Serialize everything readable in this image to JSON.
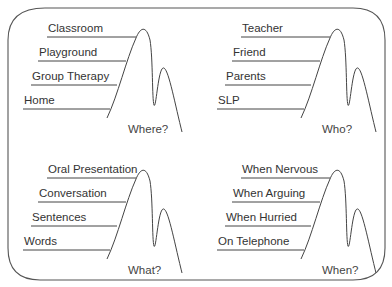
{
  "panels": [
    {
      "question": "Where?",
      "items": [
        "Classroom",
        "Playground",
        "Group Therapy",
        "Home"
      ]
    },
    {
      "question": "Who?",
      "items": [
        "Teacher",
        "Friend",
        "Parents",
        "SLP"
      ]
    },
    {
      "question": "What?",
      "items": [
        "Oral Presentation",
        "Conversation",
        "Sentences",
        "Words"
      ]
    },
    {
      "question": "When?",
      "items": [
        "When Nervous",
        "When Arguing",
        "When Hurried",
        "On Telephone"
      ]
    }
  ]
}
